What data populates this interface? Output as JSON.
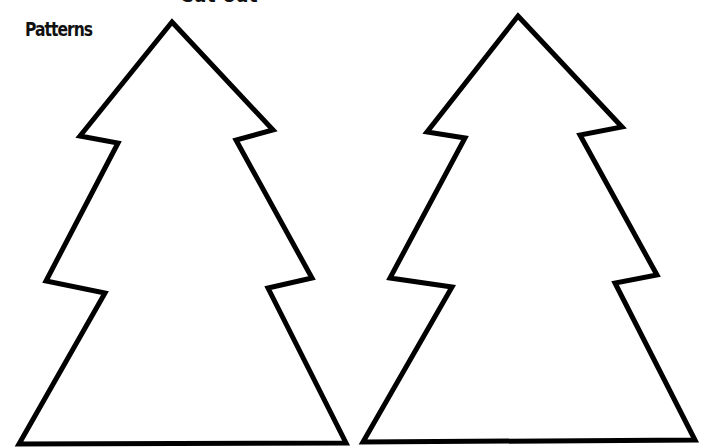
{
  "header": {
    "title": "Patterns",
    "cut_off_heading": "Cut out"
  },
  "colors": {
    "background": "#ffffff",
    "outline": "#000000"
  },
  "patterns": [
    {
      "name": "tree-left",
      "shape": "christmas-tree",
      "points": "172,22 273,130 236,140 312,278 268,288 346,443 19,444 105,293 46,281 118,143 80,136"
    },
    {
      "name": "tree-right",
      "shape": "christmas-tree",
      "points": "518,16 622,127 580,135 657,275 615,283 695,440 363,442 452,287 390,278 465,138 427,132"
    }
  ]
}
